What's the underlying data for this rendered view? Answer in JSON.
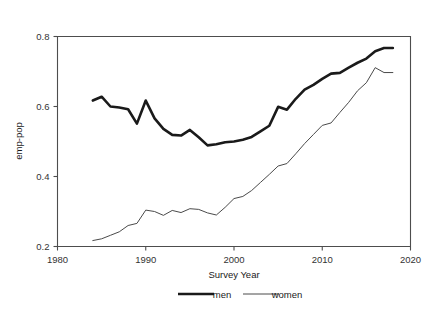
{
  "chart_data": {
    "type": "line",
    "title": "",
    "xlabel": "Survey Year",
    "ylabel": "emp-pop",
    "xlim": [
      1980,
      2020
    ],
    "ylim": [
      0.2,
      0.8
    ],
    "xticks": [
      1980,
      1990,
      2000,
      2010,
      2020
    ],
    "yticks": [
      0.2,
      0.4,
      0.6,
      0.8
    ],
    "xtick_labels": [
      "1980",
      "1990",
      "2000",
      "2010",
      "2020"
    ],
    "ytick_labels": [
      "0.2",
      "0.4",
      "0.6",
      "0.8"
    ],
    "grid": false,
    "legend_position": "bottom",
    "x": [
      1984,
      1985,
      1986,
      1987,
      1988,
      1989,
      1990,
      1991,
      1992,
      1993,
      1994,
      1995,
      1996,
      1997,
      1998,
      1999,
      2000,
      2001,
      2002,
      2003,
      2004,
      2005,
      2006,
      2007,
      2008,
      2009,
      2010,
      2011,
      2012,
      2013,
      2014,
      2015,
      2016,
      2017,
      2018
    ],
    "series": [
      {
        "name": "men",
        "color": "#1a1a1a",
        "linewidth": 2.6,
        "values": [
          0.617,
          0.628,
          0.6,
          0.597,
          0.592,
          0.551,
          0.617,
          0.566,
          0.536,
          0.519,
          0.517,
          0.533,
          0.512,
          0.489,
          0.492,
          0.498,
          0.5,
          0.505,
          0.513,
          0.529,
          0.545,
          0.599,
          0.591,
          0.622,
          0.648,
          0.662,
          0.679,
          0.694,
          0.696,
          0.711,
          0.725,
          0.737,
          0.758,
          0.767,
          0.767
        ]
      },
      {
        "name": "women",
        "color": "#4a4a4a",
        "linewidth": 1.0,
        "values": [
          0.217,
          0.222,
          0.232,
          0.242,
          0.26,
          0.266,
          0.304,
          0.3,
          0.289,
          0.303,
          0.297,
          0.308,
          0.306,
          0.296,
          0.29,
          0.312,
          0.337,
          0.343,
          0.36,
          0.383,
          0.406,
          0.43,
          0.437,
          0.465,
          0.494,
          0.52,
          0.546,
          0.553,
          0.583,
          0.612,
          0.645,
          0.668,
          0.711,
          0.697,
          0.697
        ]
      }
    ]
  },
  "legend": {
    "items": [
      {
        "label": "men"
      },
      {
        "label": "women"
      }
    ]
  }
}
